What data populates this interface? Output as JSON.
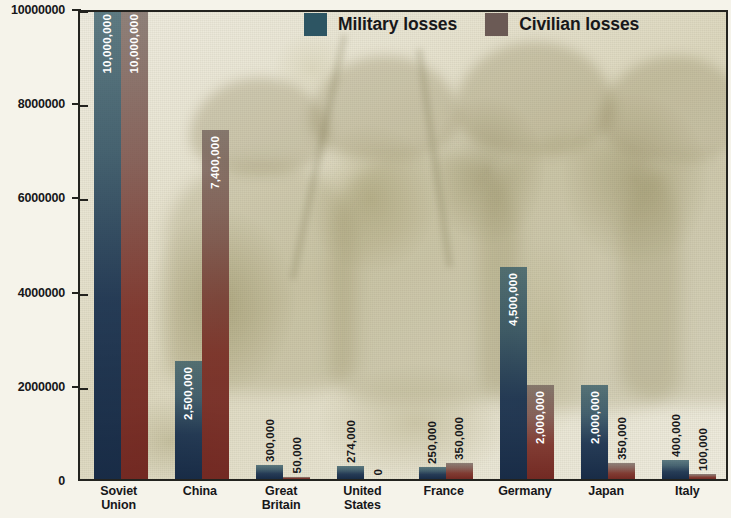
{
  "chart_data": {
    "type": "bar",
    "title": "",
    "subtitle": "",
    "xlabel": "",
    "ylabel": "",
    "ylim": [
      0,
      10000000
    ],
    "yticks": [
      0,
      2000000,
      4000000,
      6000000,
      8000000,
      10000000
    ],
    "ytick_labels": [
      "0",
      "2000000",
      "4000000",
      "6000000",
      "8000000",
      "10000000"
    ],
    "grid": false,
    "legend_position": "top-center",
    "categories": [
      "Soviet Union",
      "China",
      "Great Britain",
      "United States",
      "France",
      "Germany",
      "Japan",
      "Italy"
    ],
    "category_lines": [
      [
        "Soviet",
        "Union"
      ],
      [
        "China"
      ],
      [
        "Great",
        "Britain"
      ],
      [
        "United",
        "States"
      ],
      [
        "France"
      ],
      [
        "Germany"
      ],
      [
        "Japan"
      ],
      [
        "Italy"
      ]
    ],
    "series": [
      {
        "name": "Military losses",
        "color": "#2d5563",
        "values": [
          10000000,
          2500000,
          300000,
          274000,
          250000,
          4500000,
          2000000,
          400000
        ],
        "value_labels": [
          "10,000,000",
          "2,500,000",
          "300,000",
          "274,000",
          "250,000",
          "4,500,000",
          "2,000,000",
          "400,000"
        ]
      },
      {
        "name": "Civilian losses",
        "color": "#6b5a55",
        "values": [
          10000000,
          7400000,
          50000,
          0,
          350000,
          2000000,
          350000,
          100000
        ],
        "value_labels": [
          "10,000,000",
          "7,400,000",
          "50,000",
          "0",
          "350,000",
          "2,000,000",
          "350,000",
          "100,000"
        ]
      }
    ]
  },
  "legend": {
    "items": [
      {
        "label": "Military losses",
        "color": "#2d5563"
      },
      {
        "label": "Civilian losses",
        "color": "#6b5a55"
      }
    ]
  },
  "colors": {
    "military": "#2d5563",
    "civilian": "#6b5a55",
    "axis": "#23231f",
    "background": "#f5f3ea",
    "text": "#17171a"
  }
}
